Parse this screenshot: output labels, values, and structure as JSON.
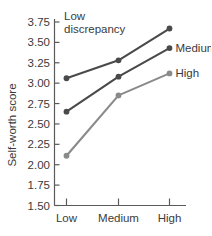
{
  "chart_data": {
    "type": "line",
    "title": "",
    "xlabel": "",
    "ylabel": "Self-worth score",
    "categories": [
      "Low",
      "Medium",
      "High"
    ],
    "ylim": [
      1.5,
      3.75
    ],
    "ytick_labels": [
      "3.75",
      "3.50",
      "3.25",
      "3.00",
      "2.75",
      "2.50",
      "2.25",
      "2.00",
      "1.75",
      "1.50"
    ],
    "ytick_values": [
      3.75,
      3.5,
      3.25,
      3.0,
      2.75,
      2.5,
      2.25,
      2.0,
      1.75,
      1.5
    ],
    "grid": false,
    "legend_position": "inline-annotations",
    "series": [
      {
        "name": "Low discrepancy",
        "label_lines": [
          "Low",
          "discrepancy"
        ],
        "label_placement": "top-left-annotation",
        "color": "#4a4a4a",
        "values": [
          3.06,
          3.28,
          3.67
        ]
      },
      {
        "name": "Medium",
        "label_lines": [
          "Medium"
        ],
        "label_placement": "right-of-endpoint",
        "color": "#4a4a4a",
        "values": [
          2.65,
          3.08,
          3.43
        ]
      },
      {
        "name": "High",
        "label_lines": [
          "High"
        ],
        "label_placement": "right-of-endpoint",
        "color": "#8a8a8a",
        "values": [
          2.11,
          2.85,
          3.12
        ]
      }
    ]
  },
  "axes": {
    "y_axis_title": "Self-worth score"
  }
}
